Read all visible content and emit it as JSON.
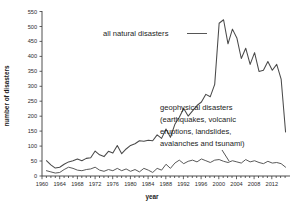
{
  "chart_data": {
    "type": "line",
    "title": "",
    "subtitle": "",
    "xlabel": "year",
    "ylabel": "number of disasters",
    "xlim": [
      1959,
      2015
    ],
    "ylim": [
      0,
      560
    ],
    "grid": false,
    "legend_position": "inline-annotations",
    "xticks": [
      1960,
      1964,
      1968,
      1972,
      1976,
      1980,
      1984,
      1988,
      1992,
      1996,
      2000,
      2004,
      2008,
      2012
    ],
    "yticks": [
      0,
      50,
      100,
      150,
      200,
      250,
      300,
      350,
      400,
      450,
      500,
      550
    ],
    "x": [
      1960,
      1961,
      1962,
      1963,
      1964,
      1965,
      1966,
      1967,
      1968,
      1969,
      1970,
      1971,
      1972,
      1973,
      1974,
      1975,
      1976,
      1977,
      1978,
      1979,
      1980,
      1981,
      1982,
      1983,
      1984,
      1985,
      1986,
      1987,
      1988,
      1989,
      1990,
      1991,
      1992,
      1993,
      1994,
      1995,
      1996,
      1997,
      1998,
      1999,
      2000,
      2001,
      2002,
      2003,
      2004,
      2005,
      2006,
      2007,
      2008,
      2009,
      2010,
      2011,
      2012,
      2013,
      2014
    ],
    "series": [
      {
        "name": "all natural disasters",
        "color": "#4a4a4a",
        "values": [
          52,
          38,
          27,
          30,
          40,
          48,
          52,
          58,
          52,
          60,
          62,
          85,
          72,
          66,
          84,
          78,
          104,
          76,
          92,
          104,
          110,
          120,
          118,
          122,
          120,
          140,
          128,
          160,
          132,
          176,
          200,
          230,
          204,
          222,
          240,
          252,
          278,
          270,
          312,
          520,
          532,
          450,
          500,
          470,
          400,
          435,
          380,
          420,
          356,
          360,
          390,
          360,
          380,
          330,
          150
        ]
      },
      {
        "name": "geophysical disasters (earthquakes, volcanic eruptions, landslides, avalanches and tsunami)",
        "color": "#5a5a5a",
        "values": [
          18,
          14,
          10,
          12,
          22,
          30,
          26,
          20,
          18,
          22,
          24,
          30,
          20,
          16,
          22,
          18,
          26,
          18,
          24,
          16,
          22,
          14,
          26,
          20,
          12,
          26,
          20,
          40,
          26,
          44,
          54,
          42,
          50,
          54,
          48,
          58,
          52,
          46,
          54,
          56,
          50,
          46,
          52,
          48,
          44,
          56,
          48,
          52,
          46,
          42,
          50,
          44,
          46,
          42,
          30
        ]
      }
    ],
    "annotations": [
      {
        "name": "all-natural-disasters-annotation",
        "text": "all natural disasters",
        "points_to_year": 1999
      },
      {
        "name": "geophysical-disasters-annotation",
        "lines": [
          "geophysical disasters",
          "(earthquakes, volcanic",
          "eruptions, landslides,",
          "avalanches and tsunami)"
        ],
        "points_to_year": 2005
      }
    ]
  }
}
